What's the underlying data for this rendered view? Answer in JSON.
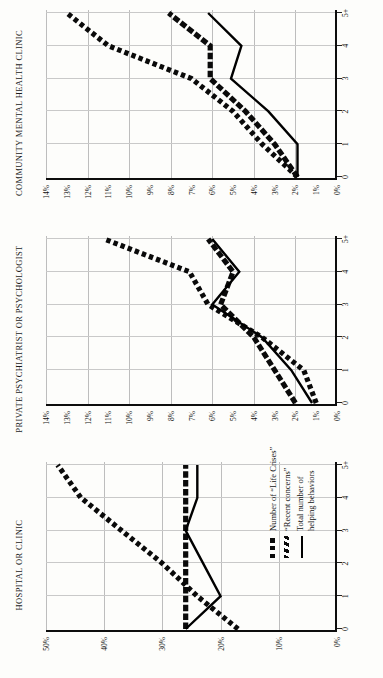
{
  "figure": {
    "orientation": "rotated-90-ccw",
    "xlabel_shared": "",
    "xticks": [
      "0",
      "1",
      "2",
      "3",
      "4",
      "5+"
    ]
  },
  "legend": {
    "position": "bottom-right-of-first-panel",
    "items": [
      {
        "key": "dotted-square-thick",
        "label": "Number of “Life Crises”"
      },
      {
        "key": "hatched-diagonal-thick",
        "label": "“Recent concerns”"
      },
      {
        "key": "solid-thin",
        "label": "Total number of\nhelping behaviors"
      }
    ]
  },
  "chart_data": [
    {
      "type": "line",
      "title": "HOSPITAL OR CLINIC",
      "xlabel": "",
      "ylabel": "",
      "x": [
        "0",
        "1",
        "2",
        "3",
        "4",
        "5+"
      ],
      "ylim": [
        0,
        50
      ],
      "yticks": [
        "0%",
        "10%",
        "20%",
        "30%",
        "40%",
        "50%"
      ],
      "ytickvals": [
        0,
        10,
        20,
        30,
        40,
        50
      ],
      "grid": true,
      "series": [
        {
          "name": "Number of “Life Crises”",
          "style": "dotted",
          "values": [
            17,
            24,
            30,
            37,
            44,
            48
          ]
        },
        {
          "name": "“Recent concerns”",
          "style": "hatched",
          "values": [
            26,
            26,
            26,
            26,
            26,
            26
          ]
        },
        {
          "name": "Total number of helping behaviors",
          "style": "solid",
          "values": [
            26,
            20,
            23,
            26,
            24,
            24
          ]
        }
      ]
    },
    {
      "type": "line",
      "title": "PRIVATE PSYCHIATRIST OR PSYCHOLOGIST",
      "xlabel": "",
      "ylabel": "",
      "x": [
        "0",
        "1",
        "2",
        "3",
        "4",
        "5+"
      ],
      "ylim": [
        0,
        14
      ],
      "yticks": [
        "0%",
        "1%",
        "2%",
        "3%",
        "4%",
        "5%",
        "6%",
        "7%",
        "8%",
        "9%",
        "10%",
        "11%",
        "12%",
        "13%",
        "14%"
      ],
      "ytickvals": [
        0,
        1,
        2,
        3,
        4,
        5,
        6,
        7,
        8,
        9,
        10,
        11,
        12,
        13,
        14
      ],
      "grid": true,
      "series": [
        {
          "name": "Number of “Life Crises”",
          "style": "dotted",
          "values": [
            1.0,
            1.6,
            3.6,
            6.2,
            7.1,
            11.2
          ]
        },
        {
          "name": "“Recent concerns”",
          "style": "hatched",
          "values": [
            2.0,
            3.0,
            4.0,
            5.6,
            5.0,
            6.2
          ]
        },
        {
          "name": "Total number of helping behaviors",
          "style": "solid",
          "values": [
            1.2,
            2.2,
            3.6,
            6.0,
            4.7,
            6.0
          ]
        }
      ]
    },
    {
      "type": "line",
      "title": "COMMUNITY MENTAL HEALTH CLINIC",
      "xlabel": "",
      "ylabel": "",
      "x": [
        "0",
        "1",
        "2",
        "3",
        "4",
        "5+"
      ],
      "ylim": [
        0,
        14
      ],
      "yticks": [
        "0%",
        "1%",
        "2%",
        "3%",
        "4%",
        "5%",
        "6%",
        "7%",
        "8%",
        "9%",
        "10%",
        "11%",
        "12%",
        "13%",
        "14%"
      ],
      "ytickvals": [
        0,
        1,
        2,
        3,
        4,
        5,
        6,
        7,
        8,
        9,
        10,
        11,
        12,
        13,
        14
      ],
      "grid": true,
      "series": [
        {
          "name": "Number of “Life Crises”",
          "style": "dotted",
          "values": [
            1.9,
            3.6,
            5.0,
            7.0,
            11.0,
            13.0
          ]
        },
        {
          "name": "“Recent concerns”",
          "style": "hatched",
          "values": [
            1.9,
            3.0,
            4.4,
            6.1,
            6.1,
            8.1
          ]
        },
        {
          "name": "Total number of helping behaviors",
          "style": "solid",
          "values": [
            1.9,
            1.9,
            3.3,
            5.1,
            4.6,
            6.2
          ]
        }
      ]
    }
  ]
}
